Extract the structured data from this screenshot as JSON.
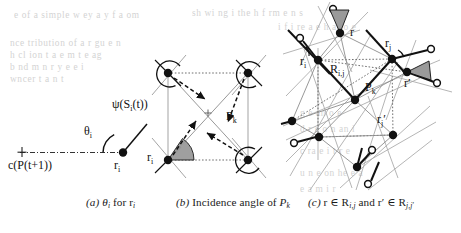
{
  "figure": {
    "panels": [
      {
        "id": "a",
        "caption_prefix": "(a)",
        "caption_text": "θi for ri",
        "labels": [
          {
            "name": "psi-label",
            "text": "ψ(Sᵢ(t))"
          },
          {
            "name": "theta-label",
            "text": "θᵢ"
          },
          {
            "name": "center-label",
            "text": "c(P(t+1))"
          },
          {
            "name": "ri-label",
            "text": "rᵢ"
          }
        ]
      },
      {
        "id": "b",
        "caption_prefix": "(b)",
        "caption_text": "Incidence angle of Pk",
        "labels": [
          {
            "name": "ri-label",
            "text": "rᵢ"
          },
          {
            "name": "pk-label",
            "text": "Pₖ"
          }
        ]
      },
      {
        "id": "c",
        "caption_prefix": "(c)",
        "caption_text": "r ∈ Ri,j and r′ ∈ Rj,j′",
        "labels": [
          {
            "name": "r-label",
            "text": "r"
          },
          {
            "name": "ri-label",
            "text": "rᵢ"
          },
          {
            "name": "rj-label",
            "text": "rⱼ"
          },
          {
            "name": "rjprime-label",
            "text": "rⱼ′"
          },
          {
            "name": "rprime-label",
            "text": "r′"
          },
          {
            "name": "region-label",
            "text": "Rᵢ,ⱼ"
          },
          {
            "name": "pk-label",
            "text": "Pₖ"
          }
        ]
      }
    ],
    "captions": {
      "a": {
        "prefix": "(a)",
        "body": "θ",
        "sub1": "i",
        "mid": " for r",
        "sub2": "i"
      },
      "b": {
        "prefix": "(b)",
        "body": "Incidence angle of ",
        "sym": "P",
        "sub": "k"
      },
      "c": {
        "prefix": "(c)",
        "body": "r ∈ R",
        "sub1": "i,j",
        "mid": " and r′ ∈ R",
        "sub2": "j,j′"
      }
    },
    "colors": {
      "ink": "#111111",
      "wedge_fill": "#9a9a9a",
      "light_line": "#8c8c8c",
      "dotted": "#6f6f6f",
      "bleed_text": "#bcbcbc",
      "background": "#ffffff"
    },
    "bleed_through": [
      {
        "text": "e of a simple  w ey  a  y  f a om",
        "x": 14,
        "y": 10
      },
      {
        "text": "sh wi ng i  the   h  f rm  e n  s",
        "x": 192,
        "y": 8
      },
      {
        "text": "i  f i re  a e   h   a   ro   e",
        "x": 278,
        "y": 22
      },
      {
        "text": "nce tribution  of   a  r  gu  e  n",
        "x": 10,
        "y": 38
      },
      {
        "text": "h cl ion  t a  e   m t   e  ag",
        "x": 10,
        "y": 50
      },
      {
        "text": "b nd  m n   r  y e     e   i   ",
        "x": 10,
        "y": 62
      },
      {
        "text": "wncer    t a  n    t",
        "x": 10,
        "y": 74
      },
      {
        "text": "g   e  an   o    e",
        "x": 300,
        "y": 108
      },
      {
        "text": "d    r  e   o  n  an  i",
        "x": 300,
        "y": 124
      },
      {
        "text": "c  ra  e   i  t  r  e",
        "x": 300,
        "y": 146
      },
      {
        "text": "u n   e  on  he   e a",
        "x": 300,
        "y": 168
      },
      {
        "text": "e a   m    i     r",
        "x": 300,
        "y": 184
      }
    ]
  }
}
